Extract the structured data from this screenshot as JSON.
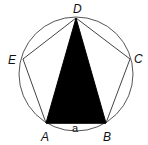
{
  "diagram": {
    "circle": {
      "cx": 76,
      "cy": 74,
      "r": 57
    },
    "vertices": {
      "A": {
        "label": "A",
        "x": 46,
        "y": 123
      },
      "B": {
        "label": "B",
        "x": 106,
        "y": 123
      },
      "C": {
        "label": "C",
        "x": 130,
        "y": 59
      },
      "D": {
        "label": "D",
        "x": 76,
        "y": 18
      },
      "E": {
        "label": "E",
        "x": 23,
        "y": 59
      }
    },
    "side_label": "a",
    "shaded_triangle": [
      "A",
      "B",
      "D"
    ],
    "colors": {
      "stroke": "#444444",
      "fill": "#000000"
    }
  }
}
